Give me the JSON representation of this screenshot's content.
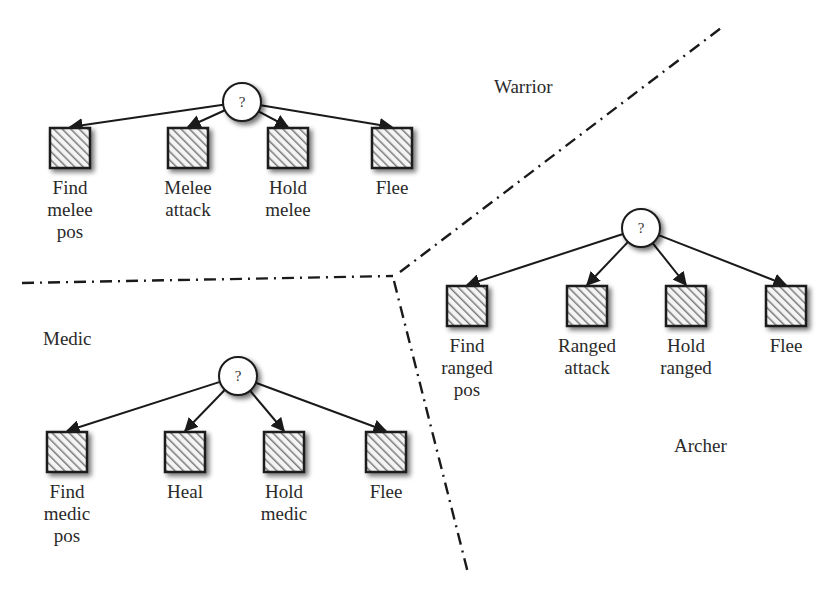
{
  "diagram": {
    "regions": [
      {
        "name": "Warrior",
        "x": 494,
        "y": 86
      },
      {
        "name": "Medic",
        "x": 43,
        "y": 338
      },
      {
        "name": "Archer",
        "x": 674,
        "y": 445
      }
    ],
    "trees": [
      {
        "id": "warrior",
        "root": {
          "label": "?",
          "x": 242,
          "y": 102
        },
        "children": [
          {
            "label": "Find\nmelee\npos",
            "x": 70,
            "y": 80
          },
          {
            "label": "Melee\nattack",
            "x": 188,
            "y": 80
          },
          {
            "label": "Hold\nmelee",
            "x": 288,
            "y": 80
          },
          {
            "label": "Flee",
            "x": 392,
            "y": 80
          }
        ]
      },
      {
        "id": "archer",
        "root": {
          "label": "?",
          "x": 641,
          "y": 228
        },
        "children": [
          {
            "label": "Find\nranged\npos",
            "x": 467,
            "y": 307
          },
          {
            "label": "Ranged\nattack",
            "x": 587,
            "y": 307
          },
          {
            "label": "Hold\nranged",
            "x": 686,
            "y": 307
          },
          {
            "label": "Flee",
            "x": 786,
            "y": 305
          }
        ]
      },
      {
        "id": "medic",
        "root": {
          "label": "?",
          "x": 238,
          "y": 376
        },
        "children": [
          {
            "label": "Find\nmedic\npos",
            "x": 67,
            "y": 453
          },
          {
            "label": "Heal",
            "x": 185,
            "y": 453
          },
          {
            "label": "Hold\nmedic",
            "x": 284,
            "y": 452
          },
          {
            "label": "Flee",
            "x": 386,
            "y": 450
          }
        ]
      }
    ],
    "colors": {
      "line": "#1a1a1a",
      "hatch": "#8a8a8a",
      "text": "#2a2a2a"
    }
  }
}
